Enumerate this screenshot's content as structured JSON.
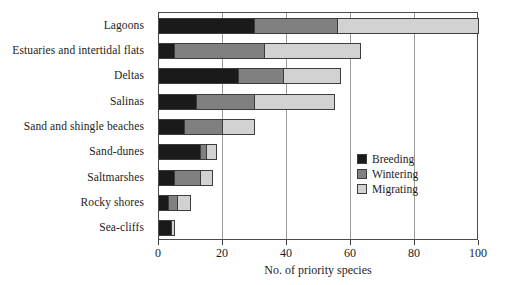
{
  "chart_data": {
    "type": "bar",
    "orientation": "horizontal",
    "stacked": true,
    "title": "",
    "xlabel": "No. of priority species",
    "ylabel": "",
    "xlim": [
      0,
      100
    ],
    "xticks": [
      0,
      20,
      40,
      60,
      80,
      100
    ],
    "xtick_labels": [
      "0",
      "20",
      "40",
      "60",
      "80",
      "100"
    ],
    "grid": "vertical",
    "legend_position": "center-right",
    "categories": [
      "Lagoons",
      "Estuaries and intertidal flats",
      "Deltas",
      "Salinas",
      "Sand and shingle beaches",
      "Sand-dunes",
      "Saltmarshes",
      "Rocky shores",
      "Sea-cliffs"
    ],
    "series": [
      {
        "name": "Breeding",
        "color": "#1a1a1a",
        "values": [
          30,
          5,
          25,
          12,
          8,
          13,
          5,
          3,
          4
        ]
      },
      {
        "name": "Wintering",
        "color": "#808080",
        "values": [
          26,
          28,
          14,
          18,
          12,
          2,
          8,
          3,
          0
        ]
      },
      {
        "name": "Migrating",
        "color": "#d2d2d2",
        "values": [
          44,
          30,
          18,
          25,
          10,
          3,
          4,
          4,
          1
        ]
      }
    ],
    "totals": [
      100,
      63,
      57,
      55,
      30,
      18,
      17,
      10,
      5
    ]
  },
  "legend": {
    "entries": [
      {
        "label": "Breeding",
        "color": "#1a1a1a"
      },
      {
        "label": "Wintering",
        "color": "#808080"
      },
      {
        "label": "Migrating",
        "color": "#d2d2d2"
      }
    ]
  }
}
